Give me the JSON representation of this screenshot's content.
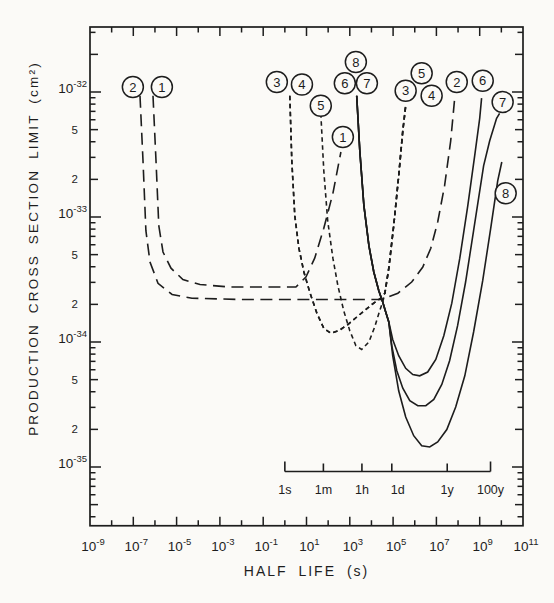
{
  "page": {
    "background": "#fbfaf7",
    "ink": "#1d1d1d"
  },
  "chart_data": {
    "type": "line",
    "title": "",
    "xlabel": "HALF LIFE (s)",
    "ylabel": "PRODUCTION CROSS SECTION LIMIT (cm²)",
    "x_axis": {
      "scale": "log",
      "unit": "s",
      "min_exp": -9,
      "max_exp": 11,
      "labeled_exps": [
        -9,
        -7,
        -5,
        -3,
        -1,
        1,
        3,
        5,
        7,
        9,
        11
      ],
      "tick_every_decade": true
    },
    "y_axis": {
      "scale": "log",
      "unit": "cm2",
      "top_exp": -31.48,
      "bottom_exp": -35.47,
      "decade_exps": [
        -32,
        -33,
        -34,
        -35
      ],
      "labeled_minor_mantissas": [
        5,
        2
      ]
    },
    "time_ruler": {
      "ticks": [
        {
          "label": "1s",
          "log_t": 0.0
        },
        {
          "label": "1m",
          "log_t": 1.78
        },
        {
          "label": "1h",
          "log_t": 3.56
        },
        {
          "label": "1d",
          "log_t": 4.94
        },
        {
          "label": "1y",
          "log_t": 7.5
        },
        {
          "label": "100y",
          "log_t": 9.5
        }
      ]
    },
    "series": [
      {
        "id": "1",
        "style": "long-dash",
        "labels": [
          {
            "log_t": -5.68,
            "log_sigma": -31.96
          },
          {
            "log_t": 2.68,
            "log_sigma": -32.36
          }
        ],
        "points": [
          [
            -6.09,
            -32.03
          ],
          [
            -5.95,
            -32.55
          ],
          [
            -5.82,
            -33.07
          ],
          [
            -5.63,
            -33.28
          ],
          [
            -5.26,
            -33.41
          ],
          [
            -4.71,
            -33.5
          ],
          [
            -3.92,
            -33.54
          ],
          [
            -2.54,
            -33.56
          ],
          [
            0.51,
            -33.56
          ],
          [
            0.97,
            -33.48
          ],
          [
            1.38,
            -33.33
          ],
          [
            1.8,
            -33.09
          ],
          [
            2.22,
            -32.81
          ],
          [
            2.59,
            -32.48
          ]
        ]
      },
      {
        "id": "2",
        "style": "long-dash",
        "labels": [
          {
            "log_t": -7.02,
            "log_sigma": -31.96
          },
          {
            "log_t": 7.94,
            "log_sigma": -31.92
          }
        ],
        "points": [
          [
            -6.69,
            -32.03
          ],
          [
            -6.55,
            -32.55
          ],
          [
            -6.42,
            -33.11
          ],
          [
            -6.23,
            -33.36
          ],
          [
            -5.86,
            -33.53
          ],
          [
            -5.21,
            -33.62
          ],
          [
            -4.29,
            -33.65
          ],
          [
            -2.08,
            -33.66
          ],
          [
            1.62,
            -33.66
          ],
          [
            4.48,
            -33.66
          ],
          [
            5.22,
            -33.61
          ],
          [
            5.86,
            -33.52
          ],
          [
            6.37,
            -33.4
          ],
          [
            6.74,
            -33.25
          ],
          [
            7.06,
            -33.04
          ],
          [
            7.38,
            -32.75
          ],
          [
            7.66,
            -32.39
          ],
          [
            7.85,
            -32.04
          ]
        ]
      },
      {
        "id": "3",
        "style": "short-dash",
        "labels": [
          {
            "log_t": -0.37,
            "log_sigma": -31.92
          },
          {
            "log_t": 5.58,
            "log_sigma": -31.99
          }
        ],
        "points": [
          [
            0.23,
            -32.03
          ],
          [
            0.32,
            -32.55
          ],
          [
            0.46,
            -32.99
          ],
          [
            0.65,
            -33.25
          ],
          [
            0.88,
            -33.44
          ],
          [
            1.15,
            -33.6
          ],
          [
            1.48,
            -33.77
          ],
          [
            1.8,
            -33.89
          ],
          [
            2.12,
            -33.93
          ],
          [
            2.49,
            -33.91
          ],
          [
            2.91,
            -33.86
          ],
          [
            3.46,
            -33.78
          ],
          [
            4.02,
            -33.7
          ],
          [
            4.43,
            -33.65
          ],
          [
            4.62,
            -33.61
          ],
          [
            4.8,
            -33.41
          ],
          [
            5.03,
            -33.07
          ],
          [
            5.26,
            -32.67
          ],
          [
            5.45,
            -32.31
          ],
          [
            5.58,
            -32.11
          ]
        ]
      },
      {
        "id": "4",
        "style": "short-dash",
        "labels": [
          {
            "log_t": 0.79,
            "log_sigma": -31.94
          },
          {
            "log_t": 6.78,
            "log_sigma": -32.03
          }
        ],
        "points": [
          [
            0.23,
            -32.03
          ],
          [
            0.32,
            -32.55
          ],
          [
            0.46,
            -32.99
          ],
          [
            0.65,
            -33.25
          ],
          [
            0.88,
            -33.44
          ],
          [
            1.15,
            -33.6
          ],
          [
            1.48,
            -33.77
          ],
          [
            1.8,
            -33.89
          ],
          [
            2.12,
            -33.93
          ],
          [
            2.49,
            -33.91
          ],
          [
            2.91,
            -33.86
          ],
          [
            3.46,
            -33.78
          ],
          [
            4.02,
            -33.7
          ],
          [
            4.43,
            -33.65
          ],
          [
            4.62,
            -33.61
          ],
          [
            4.8,
            -33.41
          ],
          [
            5.03,
            -33.07
          ],
          [
            5.26,
            -32.67
          ],
          [
            5.45,
            -32.31
          ],
          [
            5.58,
            -32.11
          ]
        ]
      },
      {
        "id": "5",
        "style": "short-dash",
        "labels": [
          {
            "log_t": 1.66,
            "log_sigma": -32.11
          },
          {
            "log_t": 6.32,
            "log_sigma": -31.85
          }
        ],
        "points": [
          [
            1.66,
            -32.17
          ],
          [
            1.8,
            -32.63
          ],
          [
            1.98,
            -33.03
          ],
          [
            2.22,
            -33.33
          ],
          [
            2.45,
            -33.55
          ],
          [
            2.72,
            -33.75
          ],
          [
            3.0,
            -33.91
          ],
          [
            3.28,
            -34.03
          ],
          [
            3.55,
            -34.06
          ],
          [
            3.88,
            -34.0
          ],
          [
            4.15,
            -33.88
          ],
          [
            4.38,
            -33.75
          ],
          [
            4.52,
            -33.68
          ],
          [
            4.62,
            -33.61
          ],
          [
            4.8,
            -33.41
          ],
          [
            5.03,
            -33.07
          ],
          [
            5.26,
            -32.67
          ],
          [
            5.45,
            -32.31
          ],
          [
            5.58,
            -32.11
          ]
        ]
      },
      {
        "id": "6",
        "style": "solid",
        "labels": [
          {
            "log_t": 2.77,
            "log_sigma": -31.93
          },
          {
            "log_t": 9.14,
            "log_sigma": -31.91
          }
        ],
        "points": [
          [
            3.32,
            -32.03
          ],
          [
            3.46,
            -32.47
          ],
          [
            3.65,
            -32.91
          ],
          [
            3.88,
            -33.23
          ],
          [
            4.11,
            -33.44
          ],
          [
            4.34,
            -33.59
          ],
          [
            4.52,
            -33.68
          ],
          [
            4.66,
            -33.76
          ],
          [
            4.8,
            -33.84
          ],
          [
            4.98,
            -33.98
          ],
          [
            5.26,
            -34.11
          ],
          [
            5.58,
            -34.21
          ],
          [
            5.91,
            -34.26
          ],
          [
            6.23,
            -34.27
          ],
          [
            6.6,
            -34.24
          ],
          [
            6.97,
            -34.14
          ],
          [
            7.34,
            -33.95
          ],
          [
            7.71,
            -33.69
          ],
          [
            8.08,
            -33.33
          ],
          [
            8.45,
            -32.91
          ],
          [
            8.77,
            -32.51
          ],
          [
            9.0,
            -32.21
          ],
          [
            9.09,
            -32.05
          ]
        ]
      },
      {
        "id": "7",
        "style": "solid",
        "labels": [
          {
            "log_t": 3.79,
            "log_sigma": -31.93
          },
          {
            "log_t": 10.06,
            "log_sigma": -32.08
          }
        ],
        "points": [
          [
            3.32,
            -32.03
          ],
          [
            3.46,
            -32.47
          ],
          [
            3.65,
            -32.91
          ],
          [
            3.88,
            -33.23
          ],
          [
            4.11,
            -33.44
          ],
          [
            4.34,
            -33.59
          ],
          [
            4.52,
            -33.68
          ],
          [
            4.66,
            -33.76
          ],
          [
            4.8,
            -33.84
          ],
          [
            4.94,
            -34.03
          ],
          [
            5.17,
            -34.23
          ],
          [
            5.45,
            -34.37
          ],
          [
            5.77,
            -34.47
          ],
          [
            6.14,
            -34.51
          ],
          [
            6.51,
            -34.51
          ],
          [
            6.88,
            -34.46
          ],
          [
            7.25,
            -34.34
          ],
          [
            7.61,
            -34.15
          ],
          [
            7.98,
            -33.87
          ],
          [
            8.35,
            -33.52
          ],
          [
            8.72,
            -33.11
          ],
          [
            9.18,
            -32.59
          ],
          [
            9.46,
            -32.39
          ],
          [
            9.78,
            -32.21
          ],
          [
            9.92,
            -32.17
          ]
        ]
      },
      {
        "id": "8",
        "style": "solid",
        "labels": [
          {
            "log_t": 3.28,
            "log_sigma": -31.76
          },
          {
            "log_t": 10.2,
            "log_sigma": -32.81
          }
        ],
        "points": [
          [
            3.32,
            -32.03
          ],
          [
            3.46,
            -32.47
          ],
          [
            3.65,
            -32.91
          ],
          [
            3.88,
            -33.23
          ],
          [
            4.11,
            -33.44
          ],
          [
            4.34,
            -33.59
          ],
          [
            4.52,
            -33.68
          ],
          [
            4.66,
            -33.76
          ],
          [
            4.8,
            -33.84
          ],
          [
            4.98,
            -34.11
          ],
          [
            5.26,
            -34.39
          ],
          [
            5.58,
            -34.6
          ],
          [
            5.95,
            -34.75
          ],
          [
            6.32,
            -34.83
          ],
          [
            6.69,
            -34.84
          ],
          [
            7.06,
            -34.8
          ],
          [
            7.48,
            -34.7
          ],
          [
            7.89,
            -34.52
          ],
          [
            8.31,
            -34.27
          ],
          [
            8.72,
            -33.92
          ],
          [
            9.14,
            -33.51
          ],
          [
            9.51,
            -33.09
          ],
          [
            9.83,
            -32.71
          ],
          [
            10.02,
            -32.56
          ]
        ]
      }
    ]
  }
}
